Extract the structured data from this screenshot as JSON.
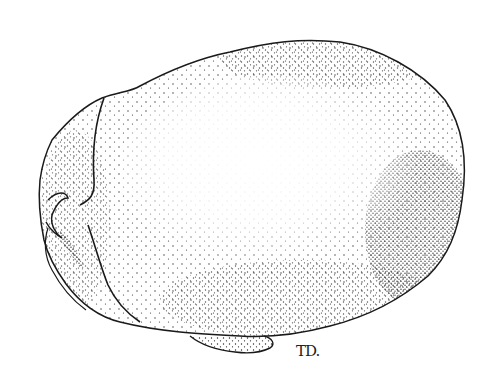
{
  "image": {
    "description": "Stippled pen-and-ink illustration of an ovoid anatomical specimen (skull-like form) viewed from above",
    "style": "stipple drawing",
    "colors": {
      "ink": "#1a1a1a",
      "background": "#ffffff"
    },
    "signature": "TD."
  }
}
